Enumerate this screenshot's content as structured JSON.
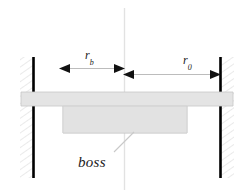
{
  "figure": {
    "background_color": "#ffffff"
  },
  "labels": {
    "boss": "boss",
    "inner_radius": {
      "variable": "r",
      "subscript": "b",
      "full": "r_b"
    },
    "outer_radius": {
      "variable": "r",
      "subscript": "0",
      "full": "r_0"
    }
  },
  "colors": {
    "plate_fill": "#e4e4e4",
    "boss_fill": "#e2e2e2",
    "plate_stroke": "#bfbfbf",
    "wall_bar": "#000000",
    "hatch_line": "#d9d9d9",
    "dimension_line": "#b9b9b9",
    "arrow_head": "#111111",
    "centerline": "#e0e0e0",
    "leader_line": "#c9c9c9",
    "text": "#1a1a1a"
  },
  "geometry": {
    "centerline_x": 124,
    "centerline_top_y": 8,
    "centerline_bottom_y": 190,
    "left_wall_x": 33,
    "right_wall_x": 220,
    "wall_top_y": 57,
    "wall_bottom_y": 178,
    "plate_top_y": 92,
    "plate_bottom_y": 106,
    "boss_bottom_y": 133,
    "boss_left_x": 63,
    "boss_right_x": 187,
    "dim_rb_y": 68,
    "dim_rb_left_x": 60,
    "dim_rb_right_x": 124,
    "dim_r0_y": 74,
    "dim_r0_left_x": 124,
    "dim_r0_right_x": 220,
    "leader_start_x": 133,
    "leader_start_y": 133,
    "leader_end_x": 113,
    "leader_end_y": 152
  },
  "elements": {
    "left_wall": "fixed-support-left",
    "right_wall": "fixed-support-right",
    "plate": "plate-section",
    "boss": "boss-section",
    "centerline": "axis-of-symmetry"
  }
}
